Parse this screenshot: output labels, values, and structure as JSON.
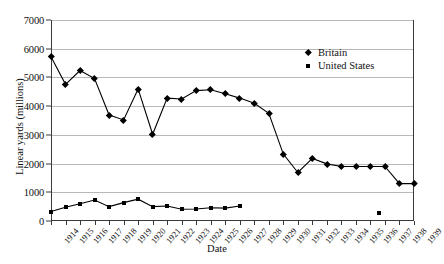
{
  "chart_data": {
    "type": "line",
    "title": "",
    "xlabel": "Date",
    "ylabel": "Linear yards (millions)",
    "x": [
      1914,
      1915,
      1916,
      1917,
      1918,
      1919,
      1920,
      1921,
      1922,
      1923,
      1924,
      1925,
      1926,
      1927,
      1928,
      1929,
      1930,
      1931,
      1932,
      1933,
      1934,
      1935,
      1936,
      1937,
      1938,
      1939
    ],
    "xlim": [
      1914,
      1939
    ],
    "ylim": [
      0,
      7000
    ],
    "yticks": [
      0,
      1000,
      2000,
      3000,
      4000,
      5000,
      6000,
      7000
    ],
    "ytick_labels": [
      "0",
      "1000",
      "2000",
      "3000",
      "4000",
      "5000",
      "6000",
      "7000"
    ],
    "xtick_labels": [
      "1914",
      "1915",
      "1916",
      "1917",
      "1918",
      "1919",
      "1920",
      "1921",
      "1922",
      "1923",
      "1924",
      "1925",
      "1926",
      "1927",
      "1928",
      "1929",
      "1930",
      "1931",
      "1932",
      "1933",
      "1934",
      "1935",
      "1936",
      "1937",
      "1938",
      "1939"
    ],
    "grid": true,
    "legend_position": "upper-right-inside",
    "series": [
      {
        "name": "Britain",
        "marker": "diamond",
        "color": "#000000",
        "x": [
          1914,
          1915,
          1916,
          1917,
          1918,
          1919,
          1920,
          1921,
          1922,
          1923,
          1924,
          1925,
          1926,
          1927,
          1928,
          1929,
          1930,
          1931,
          1932,
          1933,
          1934,
          1935,
          1936,
          1937,
          1938,
          1939
        ],
        "values": [
          5720,
          4760,
          5240,
          4960,
          3690,
          3520,
          4600,
          3020,
          4280,
          4250,
          4540,
          4570,
          4430,
          4280,
          4100,
          3750,
          2330,
          1690,
          2180,
          1990,
          1900,
          1900,
          1900,
          1900,
          1300,
          1300
        ]
      },
      {
        "name": "United States",
        "marker": "square",
        "color": "#000000",
        "x": [
          1914,
          1915,
          1916,
          1917,
          1918,
          1919,
          1920,
          1921,
          1922,
          1923,
          1924,
          1925,
          1926,
          1927
        ],
        "values": [
          330,
          480,
          600,
          730,
          500,
          640,
          760,
          500,
          520,
          410,
          420,
          460,
          450,
          520
        ],
        "extra_points": [
          {
            "x": 1936.6,
            "y": 280
          }
        ]
      }
    ]
  },
  "legend": {
    "items": [
      {
        "label": "Britain",
        "marker": "diamond"
      },
      {
        "label": "United States",
        "marker": "square"
      }
    ]
  }
}
